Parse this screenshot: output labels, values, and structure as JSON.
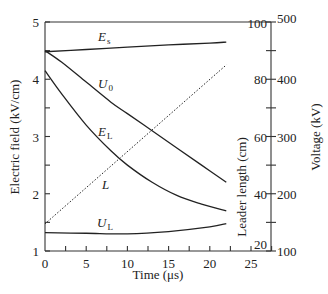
{
  "chart_data": {
    "type": "line",
    "title": "",
    "xlabel": "Time (μs)",
    "ylabel_left": "Electric field (kV/cm)",
    "ylabel_right_inner": "Leader length (cm)",
    "ylabel_right_outer": "Voltage (kV)",
    "xlim": [
      0,
      27
    ],
    "ylim_left": [
      1,
      5
    ],
    "ylim_right_inner": [
      20,
      100
    ],
    "ylim_right_outer": [
      100,
      500
    ],
    "x_ticks": [
      0,
      5,
      10,
      15,
      20,
      25
    ],
    "y_ticks_left": [
      1,
      2,
      3,
      4,
      5
    ],
    "y_ticks_right_inner": [
      20,
      40,
      60,
      80,
      100
    ],
    "y_ticks_right_outer": [
      100,
      200,
      300,
      400,
      500
    ],
    "grid": false,
    "legend": "inline labels",
    "series": [
      {
        "name": "E_s",
        "label_main": "E",
        "label_sub": "s",
        "axis": "left",
        "style": "solid",
        "x": [
          0,
          5,
          10,
          15,
          20,
          22
        ],
        "values": [
          4.48,
          4.52,
          4.56,
          4.6,
          4.63,
          4.65
        ]
      },
      {
        "name": "U_0",
        "label_main": "U",
        "label_sub": "0",
        "axis": "voltage",
        "style": "solid",
        "x": [
          0,
          2,
          5,
          8,
          10,
          13,
          16,
          19,
          22
        ],
        "values": [
          450,
          430,
          395,
          360,
          340,
          310,
          280,
          250,
          220
        ]
      },
      {
        "name": "E_L",
        "label_main": "E",
        "label_sub": "L",
        "axis": "left",
        "style": "solid",
        "x": [
          0,
          2,
          5,
          8,
          10,
          13,
          16,
          19,
          22
        ],
        "values": [
          4.15,
          3.75,
          3.2,
          2.75,
          2.5,
          2.2,
          1.97,
          1.82,
          1.7
        ]
      },
      {
        "name": "L",
        "label_main": "L",
        "label_sub": "",
        "axis": "leader",
        "style": "dotted",
        "x": [
          0,
          22
        ],
        "values": [
          29.5,
          85
        ]
      },
      {
        "name": "U_L",
        "label_main": "U",
        "label_sub": "L",
        "axis": "voltage",
        "style": "solid",
        "x": [
          0,
          5,
          10,
          15,
          20,
          22
        ],
        "values": [
          132,
          131,
          130,
          134,
          142,
          148
        ]
      }
    ]
  }
}
